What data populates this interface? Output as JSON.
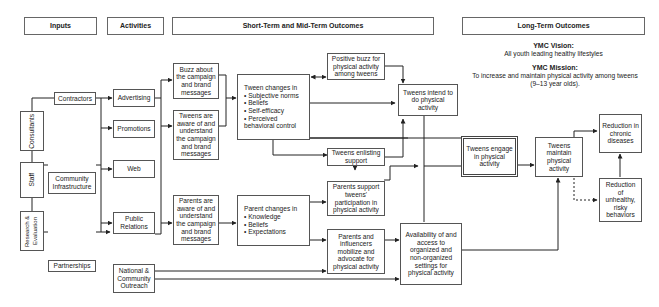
{
  "headers": {
    "inputs": "Inputs",
    "activities": "Activities",
    "short_mid": "Short-Term and Mid-Term Outcomes",
    "long_term": "Long-Term Outcomes"
  },
  "vision": {
    "vision_title": "YMC Vision:",
    "vision_text": "All youth leading healthy lifestyles",
    "mission_title": "YMC Mission:",
    "mission_text": "To increase and maintain physical activity among tweens",
    "mission_text2": "(9–13 year olds)."
  },
  "inputs": {
    "consultants": "Consultants",
    "staff": "Staff",
    "research": "Research & Evaluation",
    "contractors": "Contractors",
    "community_infrastructure": "Community Infrastructure",
    "partnerships": "Partnerships"
  },
  "activities": {
    "advertising": "Advertising",
    "promotions": "Promotions",
    "web": "Web",
    "public_relations": "Public Relations",
    "national_outreach": "National & Community Outreach"
  },
  "outcomes": {
    "buzz": "Buzz about the campaign and brand messages",
    "tweens_aware": "Tweens are aware of and understand the campaign and brand messages",
    "parents_aware": "Parents are aware of and understand the campaign and brand messages",
    "tween_changes_title": "Tween changes in",
    "tween_changes_items": [
      "Subjective norms",
      "Beliefs",
      "Self-efficacy",
      "Perceived behavioral control"
    ],
    "parent_changes_title": "Parent changes in",
    "parent_changes_items": [
      "Knowledge",
      "Beliefs",
      "Expectations"
    ],
    "positive_buzz": "Positive buzz for physical activity among tweens",
    "tweens_intend": "Tweens intend to do physical activity",
    "tweens_enlisting": "Tweens enlisting support",
    "parents_support": "Parents support tweens' participation in physical activity",
    "parents_influencers": "Parents and influencers mobilize and advocate for physical activity",
    "availability": "Availability of and access to organized and non-organized settings for physical activity"
  },
  "long_term": {
    "tweens_engage": "Tweens engage in physical activity",
    "tweens_maintain": "Tweens maintain physical activity",
    "reduction_chronic": "Reduction in chronic diseases",
    "reduction_unhealthy": "Reduction of unhealthy, risky behaviors"
  }
}
